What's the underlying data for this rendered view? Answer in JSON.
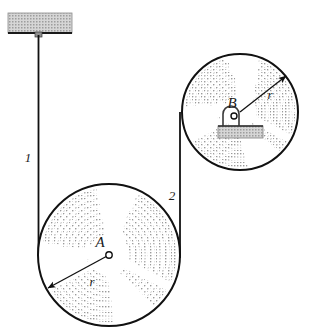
{
  "figure": {
    "type": "physics-pulley-diagram",
    "background_color": "#ffffff",
    "line_color": "#111111",
    "hatch_color": "#b9b9b9",
    "block_fill": "#cfcfcf"
  },
  "labels": {
    "pulley_a_center": "A",
    "pulley_b_center": "B",
    "radius_a": "r",
    "radius_b": "r",
    "cord_one": "1",
    "cord_two": "2"
  },
  "geometry": {
    "ceiling_block": {
      "x": 8,
      "y": 13,
      "width": 64,
      "height": 20
    },
    "cord_one": {
      "x": 38,
      "y_top": 35,
      "y_bottom": 256
    },
    "cord_two": {
      "x": 180,
      "y_top": 112,
      "y_bottom": 258
    },
    "pulley_a": {
      "cx": 109,
      "cy": 255,
      "r": 71
    },
    "pulley_b": {
      "cx": 240,
      "cy": 112,
      "r": 58
    },
    "radius_arrow_a": {
      "angle_deg": 208,
      "label_x": 92,
      "label_y": 282
    },
    "radius_arrow_b": {
      "angle_deg": 38,
      "label_x": 268,
      "label_y": 97
    },
    "support_block_b": {
      "x": 218,
      "y": 126,
      "width": 45,
      "height": 12
    },
    "label_cord_one": {
      "x": 24,
      "y": 159
    },
    "label_cord_two": {
      "x": 167,
      "y": 197
    }
  }
}
